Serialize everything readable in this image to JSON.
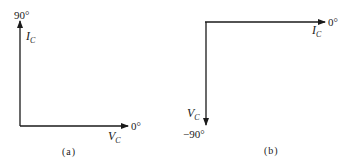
{
  "figure": {
    "panels": [
      {
        "id": "a",
        "caption": "(a)",
        "phasors": [
          {
            "name": "I",
            "subscript": "C",
            "angle_label": "90°",
            "direction": "up"
          },
          {
            "name": "V",
            "subscript": "C",
            "angle_label": "0°",
            "direction": "right"
          }
        ]
      },
      {
        "id": "b",
        "caption": "(b)",
        "phasors": [
          {
            "name": "I",
            "subscript": "C",
            "angle_label": "0°",
            "direction": "right"
          },
          {
            "name": "V",
            "subscript": "C",
            "angle_label": "−90°",
            "direction": "down"
          }
        ]
      }
    ],
    "colors": {
      "stroke": "#1a1a1a",
      "background": "#ffffff"
    }
  }
}
